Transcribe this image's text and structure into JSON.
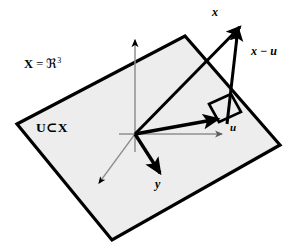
{
  "figure": {
    "background_color": "#ffffff"
  },
  "labels": {
    "ambient_space": {
      "bold_symbol": "X",
      "equals": " = ",
      "fraktur_r": "ℜ",
      "exponent": "3",
      "full_text": "X = ℜ3"
    },
    "subspace": "U⊂X",
    "vector_x": "x",
    "vector_u": "u",
    "vector_y": "y",
    "vector_x_minus_u": "x − u"
  },
  "colors": {
    "plane_fill": "#eeeeee",
    "plane_stroke": "#000000",
    "vector_stroke": "#000000",
    "axis_gray": "#8a8a8a",
    "text": "#000000"
  },
  "geometry": {
    "plane_corners": [
      [
        17,
        124
      ],
      [
        185,
        36
      ],
      [
        280,
        145
      ],
      [
        112,
        240
      ]
    ],
    "origin": [
      135,
      134
    ],
    "z_axis_tip": [
      135,
      33
    ],
    "gray_x_axis_tip": [
      228,
      134
    ],
    "gray_diag_axis_tip": [
      95,
      187
    ],
    "vector_x_tip": [
      243,
      23
    ],
    "vector_u_tip": [
      222,
      120
    ],
    "vector_y_tip": [
      163,
      177
    ],
    "x_minus_u_base": [
      226,
      122
    ],
    "x_minus_u_tip": [
      238,
      25
    ],
    "right_angle_marker": [
      [
        210,
        103
      ],
      [
        232,
        95
      ],
      [
        241,
        111
      ],
      [
        219,
        120
      ]
    ]
  },
  "elements": {
    "plane_name": "subspace-plane",
    "z_axis_name": "z-axis",
    "x_axis_name": "x-axis",
    "diag_axis_name": "diagonal-axis"
  }
}
